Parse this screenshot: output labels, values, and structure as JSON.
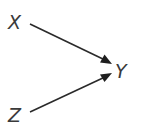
{
  "diagram": {
    "type": "causal-graph",
    "nodes": [
      {
        "id": "X",
        "label": "X"
      },
      {
        "id": "Y",
        "label": "Y"
      },
      {
        "id": "Z",
        "label": "Z"
      }
    ],
    "edges": [
      {
        "from": "X",
        "to": "Y"
      },
      {
        "from": "Z",
        "to": "Y"
      }
    ],
    "colors": {
      "text": "#3a3a3a",
      "edge": "#2a2a2a",
      "background": "#ffffff"
    }
  }
}
